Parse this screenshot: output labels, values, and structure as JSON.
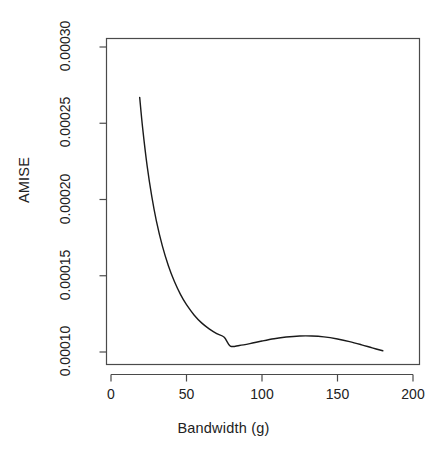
{
  "chart_data": {
    "type": "line",
    "title": "",
    "xlabel": "Bandwidth (g)",
    "ylabel": "AMISE",
    "xlim": [
      -8,
      205
    ],
    "ylim": [
      9.15e-05,
      0.0003
    ],
    "xticks": [
      0,
      50,
      100,
      150,
      200
    ],
    "xtick_labels": [
      "0",
      "50",
      "100",
      "150",
      "200"
    ],
    "yticks": [
      0.0001,
      0.00015,
      0.0002,
      0.00025,
      0.0003
    ],
    "ytick_labels": [
      "0.00010",
      "0.00015",
      "0.00020",
      "0.00025",
      "0.00030"
    ],
    "grid": false,
    "legend": null,
    "box": true,
    "series": [
      {
        "name": "AMISE(g)",
        "color": "#1a1a1a",
        "linewidth": 1.4,
        "x": [
          19,
          21,
          24,
          27,
          30,
          34,
          38,
          42,
          46,
          50,
          55,
          60,
          65,
          70,
          75,
          79,
          85,
          92,
          100,
          108,
          116,
          125,
          133,
          141,
          150,
          158,
          166,
          173,
          180
        ],
        "y": [
          0.000267,
          0.0002465,
          0.0002215,
          0.000202,
          0.0001862,
          0.0001696,
          0.0001566,
          0.0001462,
          0.0001378,
          0.000131,
          0.0001243,
          0.0001191,
          0.0001152,
          0.0001121,
          0.0001097,
          0.0001039,
          0.0001043,
          0.0001055,
          0.0001072,
          0.0001087,
          0.0001098,
          0.0001105,
          0.0001105,
          0.0001099,
          0.0001085,
          0.0001068,
          0.0001047,
          0.0001027,
          0.0001008
        ]
      }
    ]
  },
  "labels": {
    "ylabel": "AMISE",
    "xlabel": "Bandwidth (g)"
  },
  "colors": {
    "curve": "#1a1a1a",
    "axis": "#4a4a4a",
    "text": "#222222",
    "background": "#ffffff"
  }
}
